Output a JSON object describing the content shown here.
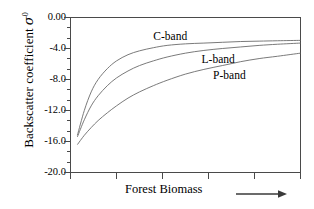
{
  "chart_data": {
    "type": "line",
    "title": "",
    "xlabel": "Forest Biomass",
    "ylabel": "Backscatter coefficient σ⁰",
    "ylabel_parts": {
      "text": "Backscatter coefficient ",
      "symbol": "σ",
      "superscript": "0"
    },
    "ylim": [
      -20.0,
      0.0
    ],
    "ytick_labels": [
      "0.00",
      "-4.0",
      "-8.0",
      "-12.0",
      "-16.0",
      "-20.0"
    ],
    "ytick_values": [
      0.0,
      -4.0,
      -8.0,
      -12.0,
      -16.0,
      -20.0
    ],
    "yminor_count_per_major": 2,
    "xlim": [
      0,
      100
    ],
    "xtick_labels": [
      "",
      "",
      "",
      "",
      "",
      ""
    ],
    "xtick_values": [
      0,
      20,
      40,
      60,
      80,
      100
    ],
    "grid": false,
    "legend_position": "inline-annotations",
    "x_axis_arrow": true,
    "series": [
      {
        "name": "C-band",
        "label": "C-band",
        "color": "#6b6b6b",
        "label_x_pct": 36,
        "label_y_pct": 8,
        "x": [
          3,
          6,
          9,
          12,
          16,
          20,
          25,
          30,
          36,
          42,
          50,
          58,
          66,
          74,
          82,
          90,
          100
        ],
        "y": [
          -15.2,
          -12.0,
          -9.6,
          -8.0,
          -6.6,
          -5.6,
          -4.8,
          -4.3,
          -3.9,
          -3.6,
          -3.4,
          -3.3,
          -3.2,
          -3.1,
          -3.05,
          -3.0,
          -2.95
        ]
      },
      {
        "name": "L-band",
        "label": "L-band",
        "color": "#6b6b6b",
        "label_x_pct": 57,
        "label_y_pct": 23,
        "x": [
          3,
          6,
          9,
          12,
          16,
          20,
          25,
          30,
          36,
          42,
          50,
          58,
          66,
          74,
          82,
          90,
          100
        ],
        "y": [
          -15.4,
          -13.2,
          -11.4,
          -10.1,
          -8.8,
          -7.8,
          -6.9,
          -6.2,
          -5.6,
          -5.1,
          -4.6,
          -4.25,
          -4.0,
          -3.8,
          -3.6,
          -3.45,
          -3.3
        ]
      },
      {
        "name": "P-band",
        "label": "P-band",
        "color": "#6b6b6b",
        "label_x_pct": 62,
        "label_y_pct": 33,
        "x": [
          3,
          6,
          9,
          12,
          16,
          20,
          25,
          30,
          36,
          42,
          50,
          58,
          66,
          74,
          82,
          90,
          100
        ],
        "y": [
          -16.4,
          -15.2,
          -14.2,
          -13.3,
          -12.3,
          -11.4,
          -10.4,
          -9.6,
          -8.8,
          -8.1,
          -7.3,
          -6.7,
          -6.2,
          -5.7,
          -5.3,
          -5.0,
          -4.6
        ]
      }
    ],
    "axis_color": "#4a4a4a",
    "text_color": "#000000"
  }
}
